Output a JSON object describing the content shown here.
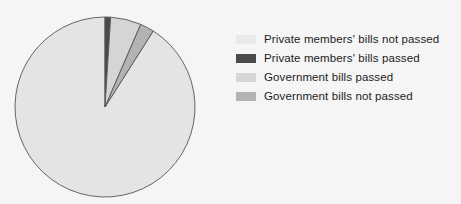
{
  "chart_data": {
    "type": "pie",
    "title": "",
    "subtitle": "",
    "xlabel": "",
    "ylabel": "",
    "grid": false,
    "legend_position": "right",
    "start_angle_deg": 90,
    "direction": "counterclockwise",
    "background_color": "#f5f5f5",
    "slice_edge_color": "#555555",
    "center_x": 105,
    "center_y": 107,
    "radius": 90,
    "categories": [
      "Private members' bills not passed",
      "Private members' bills passed",
      "Government bills passed",
      "Government bills not passed"
    ],
    "values": [
      91.0,
      1.0,
      5.5,
      2.5
    ],
    "colors": [
      "#e4e4e4",
      "#4a4a4a",
      "#d5d5d5",
      "#b3b3b3"
    ],
    "slices": [
      {
        "label": "Private members' bills not passed",
        "value": 91.0,
        "color": "#e4e4e4",
        "start_deg": 90,
        "end_deg": 417.6
      },
      {
        "label": "Private members' bills passed",
        "value": 1.0,
        "color": "#4a4a4a",
        "start_deg": 86.4,
        "end_deg": 90
      },
      {
        "label": "Government bills passed",
        "value": 5.5,
        "color": "#d5d5d5",
        "start_deg": 66.6,
        "end_deg": 86.4
      },
      {
        "label": "Government bills not passed",
        "value": 2.5,
        "color": "#b3b3b3",
        "start_deg": 57.6,
        "end_deg": 66.6
      }
    ]
  },
  "legend": {
    "items": [
      {
        "label": "Private members' bills not passed",
        "color": "#e9e9e9",
        "swatch_name": "legend-swatch-private-members-bills-not-passed"
      },
      {
        "label": "Private members' bills passed",
        "color": "#4a4a4a",
        "swatch_name": "legend-swatch-private-members-bills-passed"
      },
      {
        "label": "Government bills passed",
        "color": "#d5d5d5",
        "swatch_name": "legend-swatch-government-bills-passed"
      },
      {
        "label": "Government bills not passed",
        "color": "#b3b3b3",
        "swatch_name": "legend-swatch-government-bills-not-passed"
      }
    ]
  }
}
